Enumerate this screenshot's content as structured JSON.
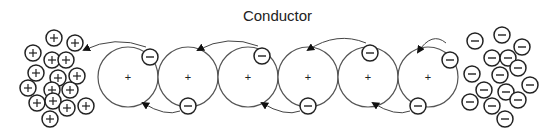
{
  "title": "Conductor",
  "colors": {
    "stroke": "#333333",
    "atom_stroke": "#555555",
    "text": "#222222"
  },
  "atoms": {
    "count": 6,
    "label": "+",
    "centers_x": [
      128,
      188,
      248,
      308,
      368,
      428
    ],
    "center_y": 77,
    "radius": 30
  },
  "positive_cluster": {
    "label": "+",
    "particles": [
      [
        54,
        38
      ],
      [
        75,
        43
      ],
      [
        33,
        53
      ],
      [
        52,
        60
      ],
      [
        66,
        60
      ],
      [
        36,
        73
      ],
      [
        58,
        78
      ],
      [
        77,
        76
      ],
      [
        28,
        88
      ],
      [
        52,
        90
      ],
      [
        70,
        90
      ],
      [
        37,
        103
      ],
      [
        53,
        101
      ],
      [
        67,
        108
      ],
      [
        86,
        106
      ],
      [
        50,
        119
      ]
    ]
  },
  "negative_cluster": {
    "label": "−",
    "particles": [
      [
        475,
        41
      ],
      [
        502,
        35
      ],
      [
        522,
        47
      ],
      [
        492,
        58
      ],
      [
        508,
        58
      ],
      [
        472,
        74
      ],
      [
        500,
        75
      ],
      [
        518,
        68
      ],
      [
        484,
        90
      ],
      [
        506,
        92
      ],
      [
        530,
        85
      ],
      [
        470,
        102
      ],
      [
        492,
        106
      ],
      [
        518,
        100
      ],
      [
        505,
        119
      ],
      [
        450,
        60
      ]
    ]
  },
  "electrons": [
    {
      "x": 150,
      "y": 57,
      "label": "−"
    },
    {
      "x": 188,
      "y": 106,
      "label": "−"
    },
    {
      "x": 262,
      "y": 56,
      "label": "−"
    },
    {
      "x": 308,
      "y": 106,
      "label": "−"
    },
    {
      "x": 370,
      "y": 53,
      "label": "−"
    },
    {
      "x": 418,
      "y": 106,
      "label": "−"
    }
  ],
  "arrows_top": [
    {
      "from": [
        146,
        47
      ],
      "to": [
        84,
        50
      ]
    },
    {
      "from": [
        258,
        46
      ],
      "to": [
        198,
        50
      ]
    },
    {
      "from": [
        366,
        43
      ],
      "to": [
        308,
        50
      ]
    },
    {
      "from": [
        446,
        43
      ],
      "to": [
        418,
        52
      ]
    }
  ],
  "arrows_bottom": [
    {
      "from": [
        180,
        111
      ],
      "to": [
        143,
        103
      ]
    },
    {
      "from": [
        300,
        111
      ],
      "to": [
        262,
        103
      ]
    },
    {
      "from": [
        410,
        111
      ],
      "to": [
        373,
        103
      ]
    }
  ]
}
